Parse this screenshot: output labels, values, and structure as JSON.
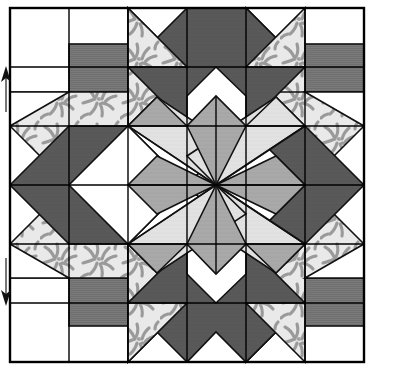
{
  "figure": {
    "title": "Pieced star quilt block diagram",
    "type": "quilt-block-line-drawing",
    "width": 397,
    "height": 383,
    "background": "#ffffff"
  },
  "block": {
    "name": "eight-pointed-star-quilt-block",
    "grid_columns": 6,
    "grid_rows": 6,
    "cell_size_px": 59,
    "origin_x": 10,
    "origin_y": 8,
    "outline_stroke": "#000000",
    "outline_width": 2,
    "grid_stroke": "#000000",
    "grid_width": 1.4,
    "piece_stroke": "#111111",
    "piece_stroke_width": 1.6
  },
  "palette": {
    "white": "#ffffff",
    "light_gray": "#e2e2e2",
    "medium_gray": "#a9a9a9",
    "dark_gray": "#595959",
    "hatch_gray": "#7b7b7b",
    "print_base": "#e9e9e9",
    "print_motif": "#9a9a9a",
    "line": "#000000"
  },
  "fabrics": [
    {
      "id": "white",
      "label": "Background white",
      "color": "#ffffff"
    },
    {
      "id": "light",
      "label": "Light gray solid",
      "color": "#e2e2e2"
    },
    {
      "id": "medium",
      "label": "Medium gray solid",
      "color": "#a9a9a9"
    },
    {
      "id": "dark",
      "label": "Dark gray solid",
      "color": "#595959"
    },
    {
      "id": "hatch",
      "label": "Gray hatched stripe",
      "color": "#7b7b7b"
    },
    {
      "id": "print",
      "label": "Gray leaf print",
      "color": "#e9e9e9"
    }
  ],
  "markers": {
    "top_arrow": {
      "name": "up-arrow-marker",
      "direction": "up",
      "x": 6,
      "y": 70,
      "length": 40
    },
    "bottom_arrow": {
      "name": "down-arrow-marker",
      "direction": "down",
      "x": 6,
      "y": 262,
      "length": 42
    }
  },
  "chart_data": {
    "type": "heatmap",
    "title": "Pieced star quilt block diagram",
    "xlabel": "",
    "ylabel": "",
    "categories": [
      "c1",
      "c2",
      "c3",
      "c4",
      "c5",
      "c6"
    ],
    "rows": [
      "r1",
      "r2",
      "r3",
      "r4",
      "r5",
      "r6"
    ],
    "legend_position": "none",
    "grid": true,
    "units": "grid cells",
    "cells": [
      {
        "r": 0,
        "c": 0,
        "pieces": [
          {
            "shape": "square",
            "fabric": "white"
          }
        ]
      },
      {
        "r": 0,
        "c": 1,
        "pieces": [
          {
            "shape": "square",
            "fabric": "white"
          }
        ]
      },
      {
        "r": 0,
        "c": 2,
        "pieces": [
          {
            "shape": "tri-tl",
            "fabric": "print"
          },
          {
            "shape": "tri-br",
            "fabric": "white"
          }
        ]
      },
      {
        "r": 0,
        "c": 3,
        "pieces": [
          {
            "shape": "tri-tr",
            "fabric": "dark"
          },
          {
            "shape": "tri-bl",
            "fabric": "white"
          }
        ]
      },
      {
        "r": 0,
        "c": 4,
        "pieces": [
          {
            "shape": "tri-tl",
            "fabric": "dark"
          },
          {
            "shape": "tri-br",
            "fabric": "white"
          }
        ]
      },
      {
        "r": 0,
        "c": 5,
        "pieces": [
          {
            "shape": "square",
            "fabric": "white"
          }
        ]
      },
      {
        "r": 1,
        "c": 0,
        "pieces": [
          {
            "shape": "square",
            "fabric": "white"
          }
        ]
      },
      {
        "r": 1,
        "c": 1,
        "pieces": [
          {
            "shape": "square",
            "fabric": "hatch"
          }
        ]
      },
      {
        "r": 1,
        "c": 2,
        "pieces": [
          {
            "shape": "square",
            "fabric": "print"
          }
        ]
      },
      {
        "r": 1,
        "c": 3,
        "pieces": [
          {
            "shape": "tri-tl",
            "fabric": "dark"
          },
          {
            "shape": "tri-br",
            "fabric": "white"
          }
        ]
      },
      {
        "r": 1,
        "c": 4,
        "pieces": [
          {
            "shape": "square",
            "fabric": "print"
          }
        ]
      },
      {
        "r": 1,
        "c": 5,
        "pieces": [
          {
            "shape": "square",
            "fabric": "hatch"
          }
        ]
      },
      {
        "r": 2,
        "c": 0,
        "pieces": [
          {
            "shape": "tri-tr",
            "fabric": "print"
          },
          {
            "shape": "tri-bl",
            "fabric": "white"
          }
        ]
      },
      {
        "r": 2,
        "c": 1,
        "pieces": [
          {
            "shape": "square",
            "fabric": "print"
          }
        ]
      },
      {
        "r": 2,
        "c": 2,
        "pieces": [
          {
            "shape": "diamond",
            "fabric": "light"
          }
        ]
      },
      {
        "r": 2,
        "c": 3,
        "pieces": [
          {
            "shape": "diamond",
            "fabric": "light"
          }
        ]
      },
      {
        "r": 2,
        "c": 4,
        "pieces": [
          {
            "shape": "square",
            "fabric": "print"
          }
        ]
      },
      {
        "r": 2,
        "c": 5,
        "pieces": [
          {
            "shape": "tri-tl",
            "fabric": "print"
          },
          {
            "shape": "tri-br",
            "fabric": "white"
          }
        ]
      },
      {
        "r": 3,
        "c": 0,
        "pieces": [
          {
            "shape": "tri-br",
            "fabric": "print"
          },
          {
            "shape": "tri-tl",
            "fabric": "white"
          }
        ]
      },
      {
        "r": 3,
        "c": 1,
        "pieces": [
          {
            "shape": "chevron",
            "fabric": "dark"
          }
        ]
      },
      {
        "r": 3,
        "c": 2,
        "pieces": [
          {
            "shape": "diamond",
            "fabric": "medium"
          }
        ]
      },
      {
        "r": 3,
        "c": 3,
        "pieces": [
          {
            "shape": "diamond",
            "fabric": "medium"
          }
        ]
      },
      {
        "r": 3,
        "c": 4,
        "pieces": [
          {
            "shape": "chevron",
            "fabric": "dark"
          }
        ]
      },
      {
        "r": 3,
        "c": 5,
        "pieces": [
          {
            "shape": "tri-bl",
            "fabric": "print"
          },
          {
            "shape": "tri-tr",
            "fabric": "white"
          }
        ]
      },
      {
        "r": 4,
        "c": 0,
        "pieces": [
          {
            "shape": "square",
            "fabric": "white"
          }
        ]
      },
      {
        "r": 4,
        "c": 1,
        "pieces": [
          {
            "shape": "square",
            "fabric": "hatch"
          }
        ]
      },
      {
        "r": 4,
        "c": 2,
        "pieces": [
          {
            "shape": "square",
            "fabric": "print"
          }
        ]
      },
      {
        "r": 4,
        "c": 3,
        "pieces": [
          {
            "shape": "tri-bl",
            "fabric": "dark"
          },
          {
            "shape": "tri-tr",
            "fabric": "white"
          }
        ]
      },
      {
        "r": 4,
        "c": 4,
        "pieces": [
          {
            "shape": "square",
            "fabric": "print"
          }
        ]
      },
      {
        "r": 4,
        "c": 5,
        "pieces": [
          {
            "shape": "square",
            "fabric": "hatch"
          }
        ]
      },
      {
        "r": 5,
        "c": 0,
        "pieces": [
          {
            "shape": "square",
            "fabric": "white"
          }
        ]
      },
      {
        "r": 5,
        "c": 1,
        "pieces": [
          {
            "shape": "square",
            "fabric": "white"
          }
        ]
      },
      {
        "r": 5,
        "c": 2,
        "pieces": [
          {
            "shape": "tri-bl",
            "fabric": "print"
          },
          {
            "shape": "tri-tr",
            "fabric": "white"
          }
        ]
      },
      {
        "r": 5,
        "c": 3,
        "pieces": [
          {
            "shape": "tri-br",
            "fabric": "dark"
          },
          {
            "shape": "tri-tl",
            "fabric": "white"
          }
        ]
      },
      {
        "r": 5,
        "c": 4,
        "pieces": [
          {
            "shape": "tri-bl",
            "fabric": "dark"
          },
          {
            "shape": "tri-tr",
            "fabric": "white"
          }
        ]
      },
      {
        "r": 5,
        "c": 5,
        "pieces": [
          {
            "shape": "square",
            "fabric": "white"
          }
        ]
      }
    ]
  }
}
